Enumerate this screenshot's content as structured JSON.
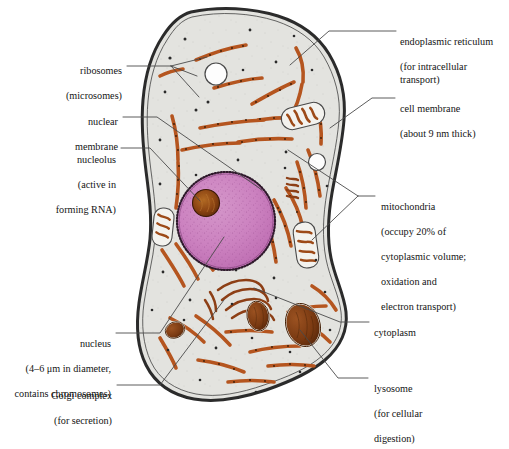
{
  "figure": {
    "background_color": "#ffffff",
    "cytoplasm_color": "#e3e3df",
    "membrane_color": "#2b2b2b",
    "nucleus_color": "#cc82c0",
    "nucleus_stipple_color": "#9c4f92",
    "nucleolus_color": "#7a3a10",
    "er_color": "#b5551f",
    "lysosome_color": "#7a3a12",
    "vacuole_color": "#fdfdfd",
    "leader_line_color": "#4a4a4a"
  },
  "labels": {
    "endoplasmic_reticulum": {
      "line1": "endoplasmic reticulum",
      "line2": "(for intracellular transport)"
    },
    "cell_membrane": {
      "line1": "cell membrane",
      "line2": "(about 9 nm thick)"
    },
    "mitochondria": {
      "line1": "mitochondria",
      "line2": "(occupy 20% of",
      "line3": "cytoplasmic volume;",
      "line4": "oxidation and",
      "line5": "electron transport)"
    },
    "cytoplasm": {
      "line1": "cytoplasm"
    },
    "lysosome": {
      "line1": "lysosome",
      "line2": "(for cellular",
      "line3": "digestion)"
    },
    "ribosomes": {
      "line1": "ribosomes",
      "line2": "(microsomes)"
    },
    "nuclear_membrane": {
      "line1": "nuclear",
      "line2": "membrane"
    },
    "nucleolus": {
      "line1": "nucleolus",
      "line2": "(active in",
      "line3": "forming RNA)"
    },
    "nucleus": {
      "line1": "nucleus",
      "line2": "(4–6 μm in diameter,",
      "line3": "contains chromosomes)"
    },
    "golgi_complex": {
      "line1": "Golgi complex",
      "line2": "(for secretion)"
    }
  }
}
